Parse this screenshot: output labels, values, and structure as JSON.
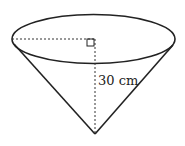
{
  "diagram": {
    "type": "cone",
    "labels": {
      "height": "30 cm"
    },
    "markers": {
      "right_angle": "right-angle-marker"
    },
    "colors": {
      "stroke": "#222222",
      "background": "#ffffff"
    }
  }
}
